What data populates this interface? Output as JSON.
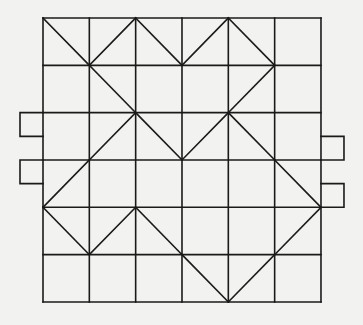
{
  "diagram": {
    "type": "grid-net",
    "grid": {
      "cols": 6,
      "rows": 6,
      "origin": [
        43,
        18
      ],
      "cell_w": 46.33,
      "cell_h": 47.33
    },
    "colors": {
      "background": "#f2f2f0",
      "line": "#1a1a1a"
    },
    "diagonals": [
      [
        [
          0,
          0
        ],
        [
          1,
          1
        ]
      ],
      [
        [
          1,
          1
        ],
        [
          2,
          0
        ]
      ],
      [
        [
          2,
          0
        ],
        [
          3,
          1
        ]
      ],
      [
        [
          3,
          1
        ],
        [
          4,
          0
        ]
      ],
      [
        [
          4,
          0
        ],
        [
          5,
          1
        ]
      ],
      [
        [
          1,
          1
        ],
        [
          2,
          2
        ]
      ],
      [
        [
          5,
          1
        ],
        [
          4,
          2
        ]
      ],
      [
        [
          2,
          2
        ],
        [
          1,
          3
        ]
      ],
      [
        [
          2,
          2
        ],
        [
          3,
          3
        ]
      ],
      [
        [
          3,
          3
        ],
        [
          4,
          2
        ]
      ],
      [
        [
          4,
          2
        ],
        [
          5,
          3
        ]
      ],
      [
        [
          1,
          3
        ],
        [
          0,
          4
        ]
      ],
      [
        [
          0,
          4
        ],
        [
          1,
          5
        ]
      ],
      [
        [
          1,
          5
        ],
        [
          2,
          4
        ]
      ],
      [
        [
          2,
          4
        ],
        [
          3,
          5
        ]
      ],
      [
        [
          3,
          5
        ],
        [
          4,
          6
        ]
      ],
      [
        [
          5,
          3
        ],
        [
          6,
          4
        ]
      ],
      [
        [
          6,
          4
        ],
        [
          5,
          5
        ]
      ],
      [
        [
          5,
          5
        ],
        [
          4,
          6
        ]
      ]
    ],
    "tabs": [
      {
        "side": "left",
        "row_start": 2,
        "row_end": 2.5
      },
      {
        "side": "left",
        "row_start": 3,
        "row_end": 3.5
      },
      {
        "side": "right",
        "row_start": 2.5,
        "row_end": 3
      },
      {
        "side": "right",
        "row_start": 3.5,
        "row_end": 4
      }
    ],
    "tab_width": 23
  }
}
